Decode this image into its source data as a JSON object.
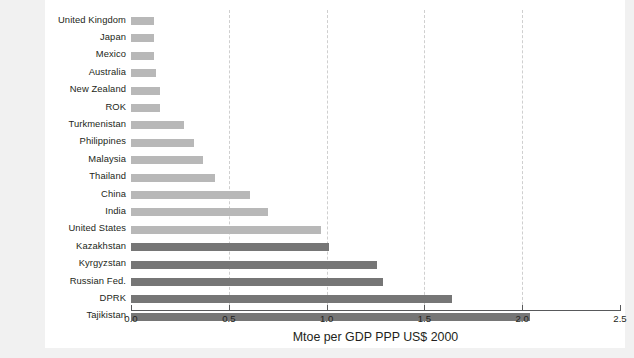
{
  "chart_data": {
    "type": "bar",
    "orientation": "horizontal",
    "title": "",
    "xlabel": "Mtoe per GDP PPP US$ 2000",
    "ylabel": "",
    "xlim": [
      0.0,
      2.5
    ],
    "xticks": [
      "0.0",
      "0.5",
      "1.0",
      "1.5",
      "2.0",
      "2.5"
    ],
    "xtick_values": [
      0.0,
      0.5,
      1.0,
      1.5,
      2.0,
      2.5
    ],
    "grid": "vertical-dashed",
    "legend": "none",
    "colors": {
      "light_bar": "#b8b8b8",
      "dark_bar": "#767676",
      "gridline": "#cfcfcf",
      "axis": "#58595b",
      "text": "#231f20",
      "panel_background": "#ffffff",
      "page_background": "#f1f1f1"
    },
    "categories": [
      "United Kingdom",
      "Japan",
      "Mexico",
      "Australia",
      "New Zealand",
      "ROK",
      "Turkmenistan",
      "Philippines",
      "Malaysia",
      "Thailand",
      "China",
      "India",
      "United States",
      "Kazakhstan",
      "Kyrgyzstan",
      "Russian Fed.",
      "DPRK",
      "Tajikistan"
    ],
    "values": [
      0.12,
      0.12,
      0.12,
      0.13,
      0.15,
      0.15,
      0.27,
      0.32,
      0.37,
      0.43,
      0.61,
      0.7,
      0.97,
      1.01,
      1.26,
      1.29,
      1.64,
      2.04
    ],
    "bars": [
      {
        "label": "United Kingdom",
        "value": 0.12,
        "group": "light"
      },
      {
        "label": "Japan",
        "value": 0.12,
        "group": "light"
      },
      {
        "label": "Mexico",
        "value": 0.12,
        "group": "light"
      },
      {
        "label": "Australia",
        "value": 0.13,
        "group": "light"
      },
      {
        "label": "New Zealand",
        "value": 0.15,
        "group": "light"
      },
      {
        "label": "ROK",
        "value": 0.15,
        "group": "light"
      },
      {
        "label": "Turkmenistan",
        "value": 0.27,
        "group": "light"
      },
      {
        "label": "Philippines",
        "value": 0.32,
        "group": "light"
      },
      {
        "label": "Malaysia",
        "value": 0.37,
        "group": "light"
      },
      {
        "label": "Thailand",
        "value": 0.43,
        "group": "light"
      },
      {
        "label": "China",
        "value": 0.61,
        "group": "light"
      },
      {
        "label": "India",
        "value": 0.7,
        "group": "light"
      },
      {
        "label": "United States",
        "value": 0.97,
        "group": "light"
      },
      {
        "label": "Kazakhstan",
        "value": 1.01,
        "group": "dark"
      },
      {
        "label": "Kyrgyzstan",
        "value": 1.26,
        "group": "dark"
      },
      {
        "label": "Russian Fed.",
        "value": 1.29,
        "group": "dark"
      },
      {
        "label": "DPRK",
        "value": 1.64,
        "group": "dark"
      },
      {
        "label": "Tajikistan",
        "value": 2.04,
        "group": "dark"
      }
    ]
  }
}
